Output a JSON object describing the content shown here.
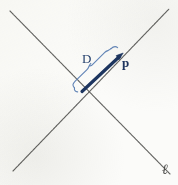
{
  "figure": {
    "background_color": "#fbfbf9",
    "labels": {
      "brace_label": "D",
      "vector_label": "p",
      "line_label": "ℓ"
    },
    "colors": {
      "line_stroke": "#5a5a58",
      "vector_stroke": "#1d3560",
      "brace_stroke": "#5b7fb5",
      "label_blue": "#24406e",
      "label_gray": "#4a4a48"
    },
    "geometry": {
      "intersection": {
        "x": 82,
        "y": 91
      },
      "line_ell": {
        "name": "line-ell",
        "from": {
          "x": 10,
          "y": 11
        },
        "to": {
          "x": 170,
          "y": 174
        },
        "label_position": {
          "x": 162,
          "y": 163
        }
      },
      "line_other": {
        "name": "line-second",
        "from": {
          "x": 13,
          "y": 171
        },
        "to": {
          "x": 169,
          "y": 9
        }
      },
      "vector_p": {
        "name": "vector-p",
        "tail": {
          "x": 82,
          "y": 91
        },
        "head": {
          "x": 122,
          "y": 54
        },
        "stroke_width": 3.2,
        "arrowhead": true
      },
      "brace_D": {
        "name": "brace-D",
        "start": {
          "x": 76,
          "y": 86
        },
        "end": {
          "x": 119,
          "y": 47
        },
        "offset": 9,
        "label_position": {
          "x": 82,
          "y": 52
        }
      }
    }
  }
}
